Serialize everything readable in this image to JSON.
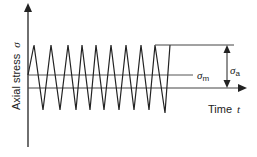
{
  "diagram": {
    "type": "cyclic-stress-time",
    "y_axis_label": "Axial stress",
    "y_axis_symbol": "σ",
    "x_axis_label": "Time",
    "x_axis_symbol": "t",
    "mean_stress_label": "σ",
    "mean_stress_sub": "m",
    "amplitude_label": "σ",
    "amplitude_sub": "a",
    "line_color": "#222222",
    "cycles": 9
  }
}
